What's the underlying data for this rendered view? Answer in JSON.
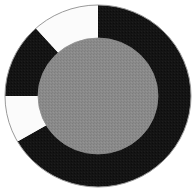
{
  "figure": {
    "background_color": "#ffffff",
    "width": 196,
    "height": 191,
    "title": "",
    "subtitle": "",
    "has_axes": false,
    "has_legend": false,
    "has_tick_labels": false,
    "has_data_labels": false
  },
  "geometry": {
    "center_x": 98,
    "center_y": 96,
    "outer_radius_x": 93,
    "outer_radius_y": 91,
    "hub_radius_x": 60,
    "hub_radius_y": 58,
    "outline_color": "#9a9a9a",
    "outline_width": 1,
    "hub_color": "#8a8a8a",
    "hub_texture_color": "#7c7c7c",
    "start_angle_deg": 0,
    "direction": "clockwise"
  },
  "palette": {
    "dark": "#141414",
    "darker": "#101010",
    "light": "#fbfbfb",
    "hub_gray": "#8a8a8a",
    "outline_gray": "#9a9a9a",
    "background": "#ffffff"
  },
  "chart_data": {
    "type": "pie",
    "title": "",
    "xlabel": "",
    "ylabel": "",
    "legend_position": "none",
    "grid": false,
    "units": "degrees",
    "total_degrees": 360,
    "inner_radius_fraction": 0.64,
    "categories": [
      "Segment A",
      "Segment B",
      "Segment C",
      "Segment D",
      "Segment E"
    ],
    "values": [
      180,
      60,
      30,
      48,
      42
    ],
    "percentages": [
      50.0,
      16.7,
      8.3,
      13.3,
      11.7
    ],
    "colors": [
      "#141414",
      "#141414",
      "#fbfbfb",
      "#141414",
      "#fbfbfb"
    ],
    "slices": [
      {
        "label": "Segment A",
        "value": 180,
        "percent": 50.0,
        "start_angle": 0,
        "end_angle": 180,
        "color": "#141414",
        "tone": "dark"
      },
      {
        "label": "Segment B",
        "value": 60,
        "percent": 16.7,
        "start_angle": 180,
        "end_angle": 240,
        "color": "#141414",
        "tone": "dark"
      },
      {
        "label": "Segment C",
        "value": 30,
        "percent": 8.3,
        "start_angle": 240,
        "end_angle": 270,
        "color": "#fbfbfb",
        "tone": "light"
      },
      {
        "label": "Segment D",
        "value": 48,
        "percent": 13.3,
        "start_angle": 270,
        "end_angle": 318,
        "color": "#141414",
        "tone": "dark"
      },
      {
        "label": "Segment E",
        "value": 42,
        "percent": 11.7,
        "start_angle": 318,
        "end_angle": 360,
        "color": "#fbfbfb",
        "tone": "light"
      }
    ]
  }
}
